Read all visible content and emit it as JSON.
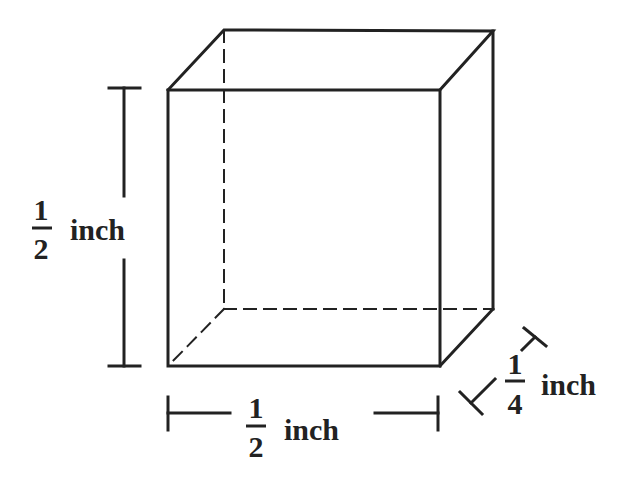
{
  "diagram": {
    "type": "rectangular prism",
    "dimensions": {
      "height": {
        "numerator": "1",
        "denominator": "2",
        "unit": "inch"
      },
      "width": {
        "numerator": "1",
        "denominator": "2",
        "unit": "inch"
      },
      "depth": {
        "numerator": "1",
        "denominator": "4",
        "unit": "inch"
      }
    },
    "colors": {
      "line": "#222222",
      "background": "#ffffff"
    }
  }
}
